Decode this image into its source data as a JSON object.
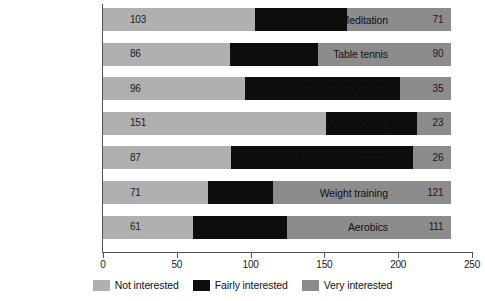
{
  "chart_data": {
    "type": "bar",
    "orientation": "horizontal",
    "stacked": true,
    "title": "",
    "xlabel": "",
    "ylabel": "",
    "xlim": [
      0,
      250
    ],
    "xticks": [
      0,
      50,
      100,
      150,
      200,
      250
    ],
    "xtick_labels": [
      "0",
      "50",
      "100",
      "150",
      "200",
      "250"
    ],
    "grid": false,
    "legend_position": "bottom-center",
    "categories": [
      "Meditation",
      "Table tennis",
      "Stress management",
      "Anti-smoking",
      "Weight loss/control",
      "Weight training",
      "Aerobics"
    ],
    "series": [
      {
        "name": "Not interested",
        "color": "#b0b0b0",
        "values": [
          103,
          86,
          96,
          151,
          87,
          71,
          61
        ]
      },
      {
        "name": "Fairly interested",
        "color": "#0d0d0d",
        "values": [
          62,
          60,
          105,
          62,
          123,
          44,
          64
        ]
      },
      {
        "name": "Very interested",
        "color": "#8c8c8c",
        "values": [
          71,
          90,
          35,
          23,
          26,
          121,
          111
        ]
      }
    ],
    "value_labels": {
      "not_interested": [
        "103",
        "86",
        "96",
        "151",
        "87",
        "71",
        "61"
      ],
      "very_interested": [
        "71",
        "90",
        "35",
        "23",
        "26",
        "121",
        "111"
      ]
    },
    "totals": [
      236,
      236,
      236,
      236,
      236,
      236,
      236
    ]
  },
  "legend": {
    "items": [
      {
        "label": "Not interested",
        "color": "#b0b0b0"
      },
      {
        "label": "Fairly interested",
        "color": "#0d0d0d"
      },
      {
        "label": "Very interested",
        "color": "#8c8c8c"
      }
    ]
  },
  "colors": {
    "not_interested": "#b0b0b0",
    "fairly_interested": "#0d0d0d",
    "very_interested": "#8c8c8c",
    "axis": "#555555",
    "text": "#111111",
    "background": "#ffffff"
  }
}
